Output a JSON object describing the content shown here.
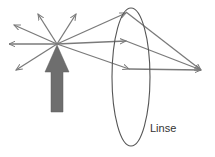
{
  "diagram": {
    "type": "optics-lens-focus",
    "labels": {
      "lens": "Linse"
    },
    "colors": {
      "ray": "#7a7a7a",
      "object_arrow": "#6e6e6e",
      "lens_outline": "#555555",
      "label": "#333333"
    },
    "point_source": {
      "x": 57,
      "y": 44
    },
    "focal_point": {
      "x": 201,
      "y": 70
    },
    "lens": {
      "cx": 131,
      "cy": 77,
      "rx": 20,
      "ry": 69
    }
  }
}
